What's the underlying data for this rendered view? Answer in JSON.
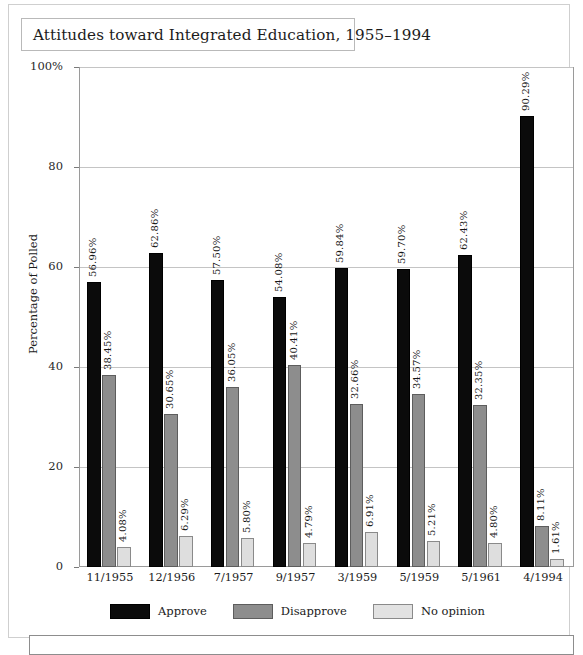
{
  "title": "Attitudes toward Integrated Education, 1955–1994",
  "chart_data": {
    "type": "bar",
    "title": "Attitudes toward Integrated Education, 1955–1994",
    "xlabel": "",
    "ylabel": "Percentage of Polled",
    "ylim": [
      0,
      100
    ],
    "yticks": [
      "0",
      "20",
      "40",
      "60",
      "80",
      "100%"
    ],
    "ytick_values": [
      0,
      20,
      40,
      60,
      80,
      100
    ],
    "grid": true,
    "legend_position": "bottom-center",
    "categories": [
      "11/1955",
      "12/1956",
      "7/1957",
      "9/1957",
      "3/1959",
      "5/1959",
      "5/1961",
      "4/1994"
    ],
    "series": [
      {
        "name": "Approve",
        "color": "#0b0b0b",
        "values": [
          56.96,
          62.86,
          57.5,
          54.08,
          59.84,
          59.7,
          62.43,
          90.29
        ],
        "labels": [
          "56.96%",
          "62.86%",
          "57.50%",
          "54.08%",
          "59.84%",
          "59.70%",
          "62.43%",
          "90.29%"
        ]
      },
      {
        "name": "Disapprove",
        "color": "#8d8d8d",
        "values": [
          38.45,
          30.65,
          36.05,
          40.41,
          32.66,
          34.57,
          32.35,
          8.11
        ],
        "labels": [
          "38.45%",
          "30.65%",
          "36.05%",
          "40.41%",
          "32.66%",
          "34.57%",
          "32.35%",
          "8.11%"
        ]
      },
      {
        "name": "No opinion",
        "color": "#dedede",
        "values": [
          4.08,
          6.29,
          5.8,
          4.79,
          6.91,
          5.21,
          4.8,
          1.61
        ],
        "labels": [
          "4.08%",
          "6.29%",
          "5.80%",
          "4.79%",
          "6.91%",
          "5.21%",
          "4.80%",
          "1.61%"
        ]
      }
    ]
  }
}
